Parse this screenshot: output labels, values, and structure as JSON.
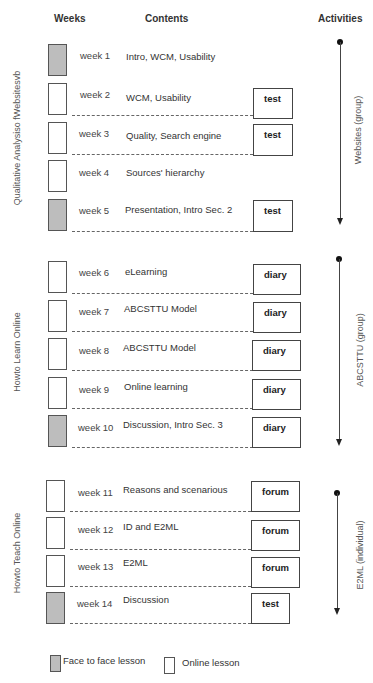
{
  "headers": {
    "weeks": "Weeks",
    "contents": "Contents",
    "activities": "Activities"
  },
  "sections": [
    {
      "label": "Qualitative Analysiso fWebsitesvb",
      "activity_label": "Websites (group)",
      "weeks": [
        {
          "label": "week 1",
          "content": "Intro, WCM, Usability",
          "type": "face-to-face",
          "activity": ""
        },
        {
          "label": "week 2",
          "content": "WCM, Usability",
          "type": "online",
          "activity": "test"
        },
        {
          "label": "week 3",
          "content": "Quality, Search engine",
          "type": "online",
          "activity": "test"
        },
        {
          "label": "week 4",
          "content": "Sources' hierarchy",
          "type": "online",
          "activity": ""
        },
        {
          "label": "week 5",
          "content": "Presentation, Intro Sec. 2",
          "type": "face-to-face",
          "activity": "test"
        }
      ]
    },
    {
      "label": "Howto Learn Online",
      "activity_label": "ABCSTTU (group)",
      "weeks": [
        {
          "label": "week 6",
          "content": "eLearning",
          "type": "online",
          "activity": "diary"
        },
        {
          "label": "week 7",
          "content": "ABCSTTU Model",
          "type": "online",
          "activity": "diary"
        },
        {
          "label": "week 8",
          "content": "ABCSTTU Model",
          "type": "online",
          "activity": "diary"
        },
        {
          "label": "week 9",
          "content": "Online learning",
          "type": "online",
          "activity": "diary"
        },
        {
          "label": "week 10",
          "content": "Discussion, Intro Sec. 3",
          "type": "face-to-face",
          "activity": "diary"
        }
      ]
    },
    {
      "label": "Howto Teach Online",
      "activity_label": "E2ML (individual)",
      "weeks": [
        {
          "label": "week 11",
          "content": "Reasons and scenarious",
          "type": "online",
          "activity": "forum"
        },
        {
          "label": "week 12",
          "content": "ID and E2ML",
          "type": "online",
          "activity": "forum"
        },
        {
          "label": "week 13",
          "content": "E2ML",
          "type": "online",
          "activity": "forum"
        },
        {
          "label": "week 14",
          "content": "Discussion",
          "type": "face-to-face",
          "activity": "test"
        }
      ]
    }
  ],
  "legend": {
    "face_to_face": "Face to face lesson",
    "online": "Online lesson"
  },
  "colors": {
    "face_to_face_fill": "#bdbdbd",
    "online_fill": "#ffffff"
  }
}
